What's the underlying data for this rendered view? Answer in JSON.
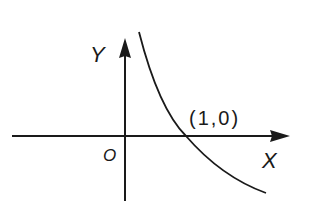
{
  "diagram": {
    "type": "function-graph",
    "axes": {
      "x_label": "X",
      "y_label": "Y",
      "origin_label": "O"
    },
    "point_label": "(1,0)",
    "curve": {
      "description": "decreasing curve passing through (1,0)",
      "color": "#1a1a1a"
    },
    "colors": {
      "background": "#ffffff",
      "ink": "#1a1a1a"
    }
  }
}
